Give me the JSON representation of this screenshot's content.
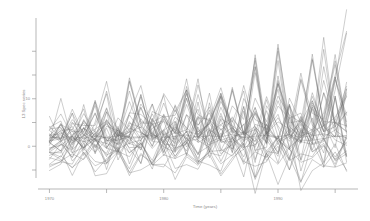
{
  "chart_data": {
    "type": "line",
    "title": "",
    "subtitle": "",
    "xlabel": "Time (years)",
    "ylabel": "13 Spec series",
    "grid": false,
    "legend": false,
    "legend_position": "none",
    "line_color": "#6f6f6f",
    "axis_color": "#9a9a9a",
    "background": "#ffffff",
    "xlim": [
      1969,
      1997
    ],
    "ylim": [
      -9,
      27
    ],
    "xticks": [
      1970,
      1980,
      1990
    ],
    "xtick_labels": [
      "1970",
      "1980",
      "1990"
    ],
    "xticks_minor": [
      1975,
      1985,
      1995
    ],
    "yticks": [
      0,
      10
    ],
    "ytick_labels": [
      "0",
      "10"
    ],
    "yticks_minor": [
      -5,
      5,
      15,
      20
    ],
    "n_series": 13,
    "x": [
      1970,
      1971,
      1972,
      1973,
      1974,
      1975,
      1976,
      1977,
      1978,
      1979,
      1980,
      1981,
      1982,
      1983,
      1984,
      1985,
      1986,
      1987,
      1988,
      1989,
      1990,
      1991,
      1992,
      1993,
      1994,
      1995,
      1996
    ],
    "series": [
      {
        "name": "series-1",
        "values": [
          2.1,
          1.4,
          3.6,
          0.8,
          9.7,
          2.2,
          1.1,
          13.8,
          4.2,
          2.0,
          6.1,
          1.3,
          8.8,
          2.4,
          5.0,
          11.2,
          3.1,
          1.8,
          7.4,
          2.6,
          21.5,
          4.0,
          2.2,
          9.1,
          3.3,
          14.6,
          5.2
        ]
      },
      {
        "name": "series-2",
        "values": [
          0.6,
          2.9,
          1.2,
          5.4,
          2.0,
          8.1,
          1.6,
          3.0,
          10.4,
          2.1,
          1.0,
          7.7,
          2.8,
          12.9,
          3.4,
          1.9,
          6.2,
          2.5,
          16.8,
          3.0,
          1.5,
          8.6,
          2.9,
          19.4,
          4.1,
          2.0,
          10.8
        ]
      },
      {
        "name": "series-3",
        "values": [
          -1.2,
          0.4,
          -0.8,
          1.9,
          0.2,
          -1.5,
          3.8,
          0.6,
          -0.3,
          5.9,
          1.1,
          -1.0,
          2.4,
          0.9,
          7.6,
          1.4,
          -0.6,
          3.2,
          1.0,
          9.8,
          2.1,
          -0.4,
          4.6,
          1.3,
          11.2,
          2.8,
          0.5
        ]
      },
      {
        "name": "series-4",
        "values": [
          3.4,
          6.8,
          2.1,
          4.9,
          1.3,
          7.2,
          3.6,
          1.0,
          5.8,
          2.4,
          9.1,
          3.0,
          1.6,
          6.4,
          2.2,
          10.9,
          3.8,
          1.2,
          7.0,
          2.6,
          13.4,
          4.2,
          1.8,
          8.2,
          3.1,
          5.4,
          12.6
        ]
      },
      {
        "name": "series-5",
        "values": [
          -2.4,
          -3.1,
          -1.6,
          -2.8,
          0.4,
          -3.6,
          -1.1,
          -2.2,
          1.2,
          -4.0,
          -1.8,
          -2.6,
          0.8,
          -3.2,
          -1.4,
          -2.0,
          2.0,
          -3.8,
          -1.2,
          -2.4,
          0.6,
          -3.0,
          -1.6,
          -2.2,
          1.8,
          -2.8,
          -1.0
        ]
      },
      {
        "name": "series-6",
        "values": [
          1.8,
          1.9,
          2.0,
          1.7,
          2.1,
          1.8,
          2.2,
          1.9,
          2.0,
          2.3,
          1.8,
          2.1,
          2.4,
          1.9,
          2.2,
          2.0,
          2.5,
          1.8,
          2.1,
          2.3,
          2.0,
          2.4,
          1.9,
          2.2,
          2.6,
          2.0,
          2.3
        ]
      },
      {
        "name": "series-7",
        "values": [
          0.2,
          4.6,
          0.8,
          2.1,
          6.9,
          1.0,
          3.4,
          0.4,
          8.2,
          1.6,
          2.8,
          0.6,
          10.1,
          2.0,
          3.8,
          1.2,
          12.4,
          2.4,
          4.2,
          0.8,
          14.8,
          2.8,
          5.0,
          1.4,
          6.2,
          17.2,
          3.0
        ]
      },
      {
        "name": "series-8",
        "values": [
          -0.6,
          1.2,
          -1.4,
          2.6,
          -0.2,
          3.8,
          -1.8,
          1.6,
          -0.8,
          4.9,
          -2.0,
          2.2,
          -1.0,
          6.1,
          -2.4,
          2.8,
          -1.2,
          7.4,
          -2.8,
          3.2,
          -1.6,
          8.8,
          -3.0,
          3.6,
          -1.4,
          10.2,
          -2.2
        ]
      },
      {
        "name": "series-9",
        "values": [
          2.6,
          0.9,
          5.1,
          1.4,
          3.2,
          11.6,
          2.0,
          4.4,
          1.1,
          6.8,
          2.4,
          3.6,
          14.2,
          1.8,
          5.2,
          2.2,
          4.0,
          1.4,
          18.6,
          2.6,
          6.0,
          1.9,
          4.8,
          2.1,
          20.4,
          3.4,
          7.2
        ]
      },
      {
        "name": "series-10",
        "values": [
          1.0,
          2.4,
          0.6,
          3.8,
          1.2,
          2.0,
          0.4,
          5.2,
          1.6,
          2.8,
          0.8,
          4.1,
          1.4,
          2.2,
          0.2,
          6.4,
          1.8,
          3.0,
          1.0,
          4.6,
          1.2,
          2.6,
          0.6,
          7.8,
          2.0,
          3.4,
          1.6
        ]
      },
      {
        "name": "series-11",
        "values": [
          -3.8,
          -2.0,
          -4.6,
          -1.2,
          -5.4,
          -2.6,
          -0.8,
          -6.2,
          -1.8,
          -3.4,
          -0.4,
          -7.0,
          -2.2,
          -4.0,
          -1.0,
          -5.8,
          -2.4,
          -0.6,
          -6.6,
          -1.6,
          -3.8,
          -0.2,
          -7.4,
          -2.8,
          -4.4,
          -1.2,
          -5.0
        ]
      },
      {
        "name": "series-12",
        "values": [
          4.2,
          1.6,
          7.8,
          2.4,
          0.9,
          5.6,
          2.0,
          9.4,
          3.1,
          1.2,
          6.8,
          2.6,
          11.0,
          3.6,
          1.4,
          8.2,
          2.8,
          12.8,
          4.0,
          1.8,
          9.6,
          3.2,
          15.4,
          4.4,
          2.2,
          11.8,
          23.8
        ]
      },
      {
        "name": "series-13",
        "values": [
          0.8,
          -1.0,
          2.2,
          -0.4,
          1.6,
          -2.2,
          3.0,
          -1.4,
          0.6,
          -3.0,
          2.6,
          -0.8,
          1.2,
          -2.6,
          3.4,
          -1.6,
          0.4,
          -3.4,
          2.8,
          -1.0,
          1.8,
          -2.8,
          3.8,
          -1.2,
          0.2,
          -3.8,
          2.4
        ]
      }
    ]
  },
  "axes": {
    "x_title": "Time (years)",
    "y_title": "13 Spec series",
    "x_tick_labels": [
      "1970",
      "1980",
      "1990"
    ],
    "y_tick_labels": [
      "0",
      "10"
    ]
  }
}
